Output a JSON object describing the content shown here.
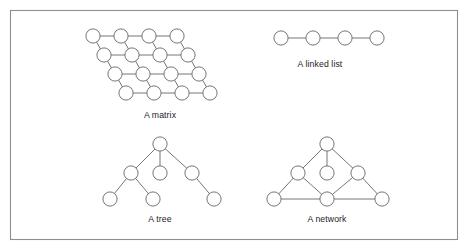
{
  "figure": {
    "background_color": "#ffffff",
    "frame": {
      "x": 10.5,
      "y": 10.5,
      "width": 447,
      "height": 229,
      "stroke_color": "#8e8e8e",
      "fill_color": "#ffffff"
    },
    "node_style": {
      "radius": 7.1,
      "fill_color": "#ffffff",
      "stroke_color": "#6f6f6f",
      "stroke_width": 0.95
    },
    "edge_style": {
      "stroke_color": "#6f6f6f",
      "stroke_width": 0.95
    },
    "caption_style": {
      "font_size": 8.7,
      "color": "#1d1d1d"
    }
  },
  "diagrams": [
    {
      "id": "matrix",
      "caption": "A matrix",
      "caption_x": 160,
      "caption_y": 118,
      "node_count": 16,
      "rows": 4,
      "columns": 4,
      "row_shift_x": 11,
      "col_spacing_x": 28,
      "row_spacing_y": 19,
      "nodes": [
        {
          "id": "m00",
          "x": 93,
          "y": 36
        },
        {
          "id": "m01",
          "x": 121,
          "y": 36
        },
        {
          "id": "m02",
          "x": 149,
          "y": 36
        },
        {
          "id": "m03",
          "x": 177,
          "y": 36
        },
        {
          "id": "m10",
          "x": 104,
          "y": 55
        },
        {
          "id": "m11",
          "x": 132,
          "y": 55
        },
        {
          "id": "m12",
          "x": 160,
          "y": 55
        },
        {
          "id": "m13",
          "x": 188,
          "y": 55
        },
        {
          "id": "m20",
          "x": 115,
          "y": 74
        },
        {
          "id": "m21",
          "x": 143,
          "y": 74
        },
        {
          "id": "m22",
          "x": 171,
          "y": 74
        },
        {
          "id": "m23",
          "x": 199,
          "y": 74
        },
        {
          "id": "m30",
          "x": 126,
          "y": 93
        },
        {
          "id": "m31",
          "x": 154,
          "y": 93
        },
        {
          "id": "m32",
          "x": 182,
          "y": 93
        },
        {
          "id": "m33",
          "x": 210,
          "y": 93
        }
      ],
      "edges": [
        [
          "m00",
          "m01"
        ],
        [
          "m01",
          "m02"
        ],
        [
          "m02",
          "m03"
        ],
        [
          "m10",
          "m11"
        ],
        [
          "m11",
          "m12"
        ],
        [
          "m12",
          "m13"
        ],
        [
          "m20",
          "m21"
        ],
        [
          "m21",
          "m22"
        ],
        [
          "m22",
          "m23"
        ],
        [
          "m30",
          "m31"
        ],
        [
          "m31",
          "m32"
        ],
        [
          "m32",
          "m33"
        ],
        [
          "m00",
          "m10"
        ],
        [
          "m01",
          "m11"
        ],
        [
          "m02",
          "m12"
        ],
        [
          "m03",
          "m13"
        ],
        [
          "m10",
          "m20"
        ],
        [
          "m11",
          "m21"
        ],
        [
          "m12",
          "m22"
        ],
        [
          "m13",
          "m23"
        ],
        [
          "m20",
          "m30"
        ],
        [
          "m21",
          "m31"
        ],
        [
          "m22",
          "m32"
        ],
        [
          "m23",
          "m33"
        ]
      ]
    },
    {
      "id": "linked-list",
      "caption": "A linked list",
      "caption_x": 320,
      "caption_y": 67,
      "node_count": 4,
      "nodes": [
        {
          "id": "l0",
          "x": 281,
          "y": 38
        },
        {
          "id": "l1",
          "x": 313,
          "y": 38
        },
        {
          "id": "l2",
          "x": 345,
          "y": 38
        },
        {
          "id": "l3",
          "x": 377,
          "y": 38
        }
      ],
      "edges": [
        [
          "l0",
          "l1"
        ],
        [
          "l1",
          "l2"
        ],
        [
          "l2",
          "l3"
        ]
      ]
    },
    {
      "id": "tree",
      "caption": "A tree",
      "caption_x": 160,
      "caption_y": 222,
      "node_count": 7,
      "nodes": [
        {
          "id": "t_root",
          "x": 160,
          "y": 144
        },
        {
          "id": "t_c1",
          "x": 131,
          "y": 173
        },
        {
          "id": "t_c2",
          "x": 160,
          "y": 173
        },
        {
          "id": "t_c3",
          "x": 192,
          "y": 173
        },
        {
          "id": "t_l1",
          "x": 110,
          "y": 199
        },
        {
          "id": "t_l2",
          "x": 153,
          "y": 199
        },
        {
          "id": "t_l3",
          "x": 214,
          "y": 199
        }
      ],
      "edges": [
        [
          "t_root",
          "t_c1"
        ],
        [
          "t_root",
          "t_c2"
        ],
        [
          "t_root",
          "t_c3"
        ],
        [
          "t_c1",
          "t_l1"
        ],
        [
          "t_c1",
          "t_l2"
        ],
        [
          "t_c3",
          "t_l3"
        ]
      ]
    },
    {
      "id": "network",
      "caption": "A network",
      "caption_x": 327,
      "caption_y": 222,
      "node_count": 7,
      "nodes": [
        {
          "id": "n_top",
          "x": 327,
          "y": 144
        },
        {
          "id": "n_ml",
          "x": 298,
          "y": 173
        },
        {
          "id": "n_mc",
          "x": 327,
          "y": 173
        },
        {
          "id": "n_mr",
          "x": 358,
          "y": 173
        },
        {
          "id": "n_bl",
          "x": 274,
          "y": 199
        },
        {
          "id": "n_bc",
          "x": 327,
          "y": 199
        },
        {
          "id": "n_br",
          "x": 382,
          "y": 199
        }
      ],
      "edges": [
        [
          "n_top",
          "n_ml"
        ],
        [
          "n_top",
          "n_mc"
        ],
        [
          "n_top",
          "n_mr"
        ],
        [
          "n_ml",
          "n_bl"
        ],
        [
          "n_ml",
          "n_bc"
        ],
        [
          "n_mr",
          "n_bc"
        ],
        [
          "n_mr",
          "n_br"
        ],
        [
          "n_bl",
          "n_bc"
        ],
        [
          "n_bc",
          "n_br"
        ]
      ]
    }
  ]
}
